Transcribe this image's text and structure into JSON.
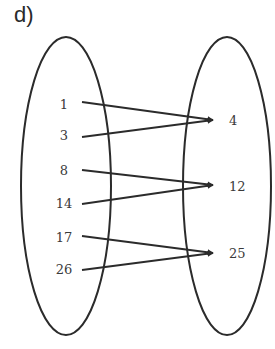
{
  "part_label": "d)",
  "domain_set": {
    "name": "left-set",
    "ellipse": {
      "cx": 66,
      "cy": 186,
      "rx": 45,
      "ry": 149
    },
    "elements": [
      {
        "label": "1",
        "x": 64,
        "y": 104
      },
      {
        "label": "3",
        "x": 64,
        "y": 135
      },
      {
        "label": "8",
        "x": 64,
        "y": 170
      },
      {
        "label": "14",
        "x": 64,
        "y": 203
      },
      {
        "label": "17",
        "x": 64,
        "y": 237
      },
      {
        "label": "26",
        "x": 64,
        "y": 269
      }
    ]
  },
  "codomain_set": {
    "name": "right-set",
    "ellipse": {
      "cx": 227,
      "cy": 186,
      "rx": 44,
      "ry": 149
    },
    "elements": [
      {
        "label": "4",
        "x": 229,
        "y": 120
      },
      {
        "label": "12",
        "x": 229,
        "y": 186
      },
      {
        "label": "25",
        "x": 229,
        "y": 253
      }
    ]
  },
  "mappings": [
    {
      "from": "1",
      "to": "4",
      "x1": 82,
      "y1": 102,
      "x2": 213,
      "y2": 120
    },
    {
      "from": "3",
      "to": "4",
      "x1": 82,
      "y1": 137,
      "x2": 213,
      "y2": 120
    },
    {
      "from": "8",
      "to": "12",
      "x1": 82,
      "y1": 170,
      "x2": 213,
      "y2": 185
    },
    {
      "from": "14",
      "to": "12",
      "x1": 82,
      "y1": 204,
      "x2": 213,
      "y2": 185
    },
    {
      "from": "17",
      "to": "25",
      "x1": 82,
      "y1": 236,
      "x2": 213,
      "y2": 253
    },
    {
      "from": "26",
      "to": "25",
      "x1": 82,
      "y1": 270,
      "x2": 213,
      "y2": 253
    }
  ],
  "colors": {
    "stroke": "#2b2b2b",
    "text": "#3a3a3a"
  }
}
